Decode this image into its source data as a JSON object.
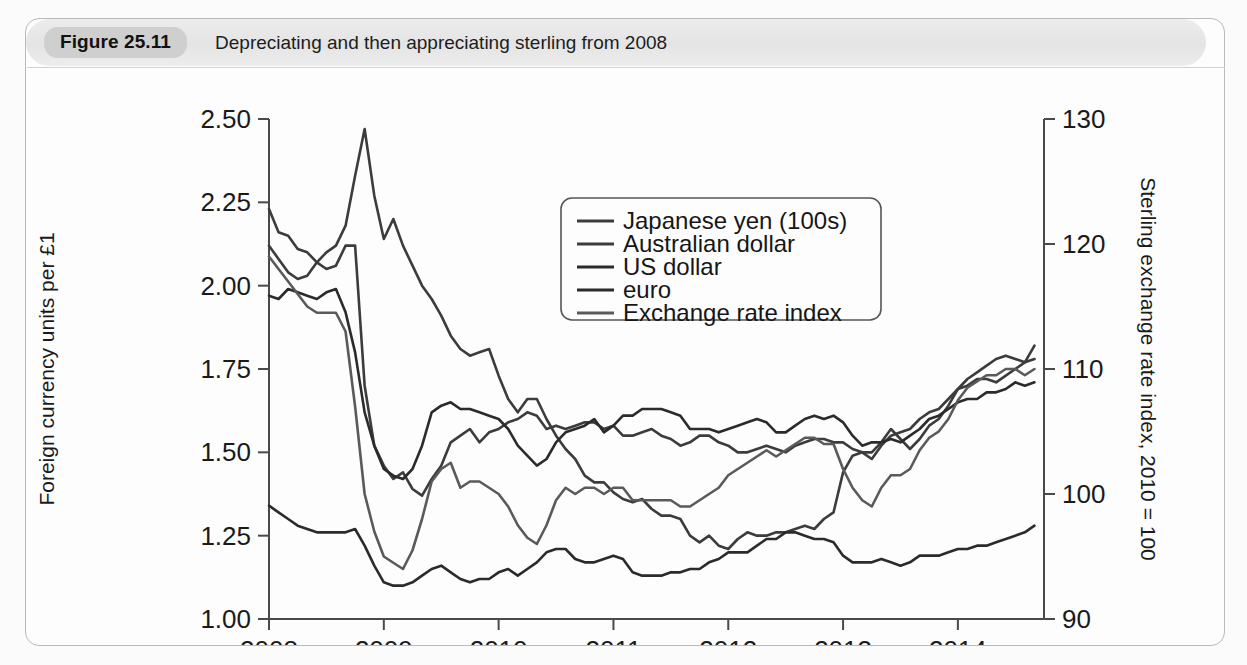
{
  "figure": {
    "number_label": "Figure 25.11",
    "caption": "Depreciating and then appreciating sterling from 2008"
  },
  "chart_data": {
    "type": "line",
    "title": "Depreciating and then appreciating sterling from 2008",
    "xlabel": "",
    "ylabel": "Foreign currency units per £1",
    "y2label": "Sterling exchange rate index, 2010 = 100",
    "xlim": [
      2008.0,
      2014.75
    ],
    "ylim": [
      1.0,
      2.5
    ],
    "y2lim": [
      90,
      130
    ],
    "grid": false,
    "legend_position": "upper-center",
    "xticks": [
      "2008",
      "2009",
      "2010",
      "2011",
      "2012",
      "2013",
      "2014"
    ],
    "xtick_values": [
      2008,
      2009,
      2010,
      2011,
      2012,
      2013,
      2014
    ],
    "yticks": [
      "1.00",
      "1.25",
      "1.50",
      "1.75",
      "2.00",
      "2.25",
      "2.50"
    ],
    "ytick_values": [
      1.0,
      1.25,
      1.5,
      1.75,
      2.0,
      2.25,
      2.5
    ],
    "y2ticks": [
      "90",
      "100",
      "110",
      "120",
      "130"
    ],
    "y2tick_values": [
      90,
      100,
      110,
      120,
      130
    ],
    "x": [
      2008.0,
      2008.083,
      2008.167,
      2008.25,
      2008.333,
      2008.417,
      2008.5,
      2008.583,
      2008.667,
      2008.75,
      2008.833,
      2008.917,
      2009.0,
      2009.083,
      2009.167,
      2009.25,
      2009.333,
      2009.417,
      2009.5,
      2009.583,
      2009.667,
      2009.75,
      2009.833,
      2009.917,
      2010.0,
      2010.083,
      2010.167,
      2010.25,
      2010.333,
      2010.417,
      2010.5,
      2010.583,
      2010.667,
      2010.75,
      2010.833,
      2010.917,
      2011.0,
      2011.083,
      2011.167,
      2011.25,
      2011.333,
      2011.417,
      2011.5,
      2011.583,
      2011.667,
      2011.75,
      2011.833,
      2011.917,
      2012.0,
      2012.083,
      2012.167,
      2012.25,
      2012.333,
      2012.417,
      2012.5,
      2012.583,
      2012.667,
      2012.75,
      2012.833,
      2012.917,
      2013.0,
      2013.083,
      2013.167,
      2013.25,
      2013.333,
      2013.417,
      2013.5,
      2013.583,
      2013.667,
      2013.75,
      2013.833,
      2013.917,
      2014.0,
      2014.083,
      2014.167,
      2014.25,
      2014.333,
      2014.417,
      2014.5,
      2014.583,
      2014.667
    ],
    "series": [
      {
        "name": "Japanese yen (100s)",
        "axis": "left",
        "color": "#3c3c3c",
        "values": [
          2.12,
          2.08,
          2.04,
          2.02,
          2.03,
          2.07,
          2.1,
          2.12,
          2.18,
          2.33,
          2.47,
          2.27,
          2.14,
          2.2,
          2.12,
          2.06,
          2.0,
          1.96,
          1.91,
          1.85,
          1.81,
          1.79,
          1.8,
          1.81,
          1.73,
          1.66,
          1.62,
          1.66,
          1.66,
          1.6,
          1.55,
          1.51,
          1.48,
          1.43,
          1.41,
          1.41,
          1.38,
          1.36,
          1.35,
          1.36,
          1.33,
          1.31,
          1.31,
          1.3,
          1.25,
          1.23,
          1.25,
          1.22,
          1.21,
          1.24,
          1.26,
          1.25,
          1.25,
          1.26,
          1.26,
          1.27,
          1.28,
          1.27,
          1.3,
          1.32,
          1.44,
          1.49,
          1.5,
          1.5,
          1.53,
          1.57,
          1.54,
          1.51,
          1.54,
          1.58,
          1.6,
          1.64,
          1.69,
          1.7,
          1.72,
          1.72,
          1.71,
          1.73,
          1.75,
          1.77,
          1.82
        ]
      },
      {
        "name": "Australian dollar",
        "axis": "left",
        "color": "#3c3c3c",
        "values": [
          2.23,
          2.16,
          2.15,
          2.11,
          2.1,
          2.07,
          2.05,
          2.06,
          2.12,
          2.12,
          1.7,
          1.52,
          1.46,
          1.42,
          1.44,
          1.39,
          1.37,
          1.42,
          1.46,
          1.53,
          1.55,
          1.57,
          1.53,
          1.56,
          1.57,
          1.59,
          1.6,
          1.62,
          1.61,
          1.57,
          1.58,
          1.57,
          1.58,
          1.59,
          1.59,
          1.57,
          1.58,
          1.55,
          1.55,
          1.56,
          1.57,
          1.55,
          1.54,
          1.52,
          1.53,
          1.55,
          1.55,
          1.53,
          1.52,
          1.5,
          1.5,
          1.51,
          1.52,
          1.51,
          1.5,
          1.52,
          1.53,
          1.54,
          1.54,
          1.53,
          1.53,
          1.51,
          1.5,
          1.48,
          1.52,
          1.55,
          1.56,
          1.57,
          1.6,
          1.62,
          1.63,
          1.66,
          1.69,
          1.72,
          1.74,
          1.76,
          1.78,
          1.79,
          1.78,
          1.77,
          1.78
        ]
      },
      {
        "name": "US dollar",
        "axis": "left",
        "color": "#2b2b2b",
        "values": [
          1.97,
          1.96,
          1.99,
          1.98,
          1.97,
          1.96,
          1.98,
          1.99,
          1.92,
          1.8,
          1.62,
          1.52,
          1.45,
          1.43,
          1.42,
          1.45,
          1.52,
          1.62,
          1.64,
          1.65,
          1.63,
          1.63,
          1.62,
          1.61,
          1.6,
          1.57,
          1.52,
          1.49,
          1.46,
          1.48,
          1.53,
          1.56,
          1.57,
          1.58,
          1.6,
          1.56,
          1.58,
          1.61,
          1.61,
          1.63,
          1.63,
          1.63,
          1.62,
          1.61,
          1.57,
          1.57,
          1.57,
          1.56,
          1.57,
          1.58,
          1.59,
          1.6,
          1.59,
          1.56,
          1.56,
          1.58,
          1.6,
          1.61,
          1.6,
          1.61,
          1.59,
          1.55,
          1.52,
          1.53,
          1.53,
          1.54,
          1.53,
          1.55,
          1.57,
          1.6,
          1.61,
          1.63,
          1.65,
          1.66,
          1.66,
          1.68,
          1.68,
          1.69,
          1.71,
          1.7,
          1.71
        ]
      },
      {
        "name": "euro",
        "axis": "left",
        "color": "#2b2b2b",
        "values": [
          1.34,
          1.32,
          1.3,
          1.28,
          1.27,
          1.26,
          1.26,
          1.26,
          1.26,
          1.27,
          1.22,
          1.16,
          1.11,
          1.1,
          1.1,
          1.11,
          1.13,
          1.15,
          1.16,
          1.14,
          1.12,
          1.11,
          1.12,
          1.12,
          1.14,
          1.15,
          1.13,
          1.15,
          1.17,
          1.2,
          1.21,
          1.21,
          1.18,
          1.17,
          1.17,
          1.18,
          1.19,
          1.18,
          1.14,
          1.13,
          1.13,
          1.13,
          1.14,
          1.14,
          1.15,
          1.15,
          1.17,
          1.18,
          1.2,
          1.2,
          1.2,
          1.22,
          1.24,
          1.24,
          1.26,
          1.26,
          1.25,
          1.24,
          1.24,
          1.23,
          1.19,
          1.17,
          1.17,
          1.17,
          1.18,
          1.17,
          1.16,
          1.17,
          1.19,
          1.19,
          1.19,
          1.2,
          1.21,
          1.21,
          1.22,
          1.22,
          1.23,
          1.24,
          1.25,
          1.26,
          1.28
        ]
      },
      {
        "name": "Exchange rate index",
        "axis": "right",
        "color": "#5a5a5a",
        "values": [
          119.0,
          118.0,
          117.0,
          116.0,
          115.0,
          114.5,
          114.5,
          114.5,
          113.0,
          107.0,
          100.0,
          97.0,
          95.0,
          94.5,
          94.0,
          95.5,
          98.0,
          101.0,
          102.0,
          102.5,
          100.5,
          101.0,
          101.0,
          100.5,
          100.0,
          99.0,
          97.5,
          96.5,
          96.0,
          97.5,
          99.5,
          100.5,
          100.0,
          100.5,
          100.5,
          100.0,
          100.5,
          100.5,
          99.5,
          99.5,
          99.5,
          99.5,
          99.5,
          99.0,
          99.0,
          99.5,
          100.0,
          100.5,
          101.5,
          102.0,
          102.5,
          103.0,
          103.5,
          103.0,
          103.5,
          104.0,
          104.5,
          104.5,
          104.0,
          104.0,
          102.0,
          100.5,
          99.5,
          99.0,
          100.5,
          101.5,
          101.5,
          102.0,
          103.5,
          104.5,
          105.0,
          106.0,
          107.5,
          108.5,
          109.0,
          109.5,
          109.5,
          110.0,
          110.0,
          109.5,
          110.0
        ]
      }
    ]
  }
}
